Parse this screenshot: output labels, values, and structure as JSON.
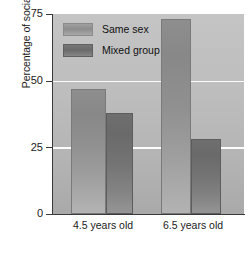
{
  "chart_data": {
    "type": "bar",
    "title": "",
    "xlabel": "",
    "ylabel": "Percentage of social playtime",
    "categories": [
      "4.5 years old",
      "6.5 years old"
    ],
    "series": [
      {
        "name": "Same sex",
        "values": [
          47,
          73
        ]
      },
      {
        "name": "Mixed group",
        "values": [
          38,
          28
        ]
      }
    ],
    "ylim": [
      0,
      75
    ],
    "yticks": [
      "0",
      "25",
      "50",
      "75"
    ],
    "grid": "horizontal-white-at-25-and-50",
    "legend_position": "top-left-inside",
    "colors": {
      "same_sex": "#8e8e8e",
      "mixed_group": "#6f6f6f",
      "plot_background": "#bdbdbd",
      "gridline": "#fdfdfd",
      "axis": "#3a3a3a",
      "text": "#1a1a1a",
      "page_background": "#ffffff"
    }
  },
  "axis": {
    "y_title": "Percentage of social playtime",
    "tick_75": "75",
    "tick_50": "50",
    "tick_25": "25",
    "tick_0": "0"
  },
  "legend": {
    "item_0_label": "Same sex",
    "item_1_label": "Mixed group"
  },
  "xaxis": {
    "group_0_label": "4.5 years old",
    "group_1_label": "6.5 years old"
  }
}
